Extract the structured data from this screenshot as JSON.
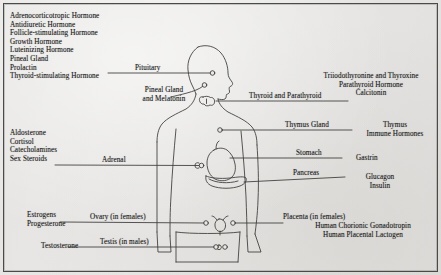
{
  "figure": {
    "ink_color": "#23221f",
    "paper_color": "#e9e8e6"
  },
  "pituitary_hormones": {
    "lines": [
      "Adrenocorticotropic Hormone",
      "Antidiuretic Hormone",
      "Follicle-stimulating Hormone",
      "Growth Hormone",
      "Luteinizing Hormone",
      "Pineal Gland",
      "Prolactin",
      "Thyroid-stimulating Hormone"
    ]
  },
  "adrenal_hormones": {
    "lines": [
      "Aldosterone",
      "Cortisol",
      "Catecholamines",
      "Sex Steroids"
    ]
  },
  "ovary_hormones": {
    "lines": [
      "Estrogens",
      "Progesterone"
    ]
  },
  "testis_hormones": {
    "lines": [
      "Testosterone"
    ]
  },
  "organ_labels": {
    "pituitary": "Pituitary",
    "pineal": "Pineal Gland\nand Melatonin",
    "pineal_line1": "Pineal Gland",
    "pineal_line2": "and Melatonin",
    "thyroid": "Thyroid and Parathyroid",
    "thymus": "Thymus Gland",
    "stomach": "Stomach",
    "pancreas": "Pancreas",
    "adrenal": "Adrenal",
    "ovary": "Ovary (in females)",
    "testis": "Testis (in males)",
    "placenta": "Placenta (in females)"
  },
  "thyroid_hormones": {
    "lines": [
      "Triiodothyronine and Thyroxine",
      "Parathyroid Hormone",
      "Calcitonin"
    ]
  },
  "thymus_hormones": {
    "lines": [
      "Thymus",
      "Immune Hormones"
    ]
  },
  "stomach_hormones": {
    "lines": [
      "Gastrin"
    ]
  },
  "pancreas_hormones": {
    "lines": [
      "Glucagon",
      "Insulin"
    ]
  },
  "placenta_hormones": {
    "lines": [
      "Human Chorionic Gonadotropin",
      "Human Placental Lactogen"
    ]
  }
}
